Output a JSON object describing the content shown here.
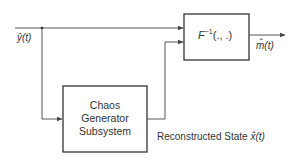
{
  "diagram": {
    "input_signal": {
      "label": "ŷ(t)"
    },
    "inverse_block": {
      "label_base": "F",
      "label_sup": "−1",
      "label_args": "(., .)"
    },
    "output_signal": {
      "label": "m̂(t)"
    },
    "chaos_block": {
      "lines": [
        "Chaos",
        "Generator",
        "Subsystem"
      ]
    },
    "state_signal": {
      "text": "Reconstructed State",
      "symbol": "x̂(t)"
    },
    "colors": {
      "line": "#444444",
      "box": "#333333"
    }
  }
}
